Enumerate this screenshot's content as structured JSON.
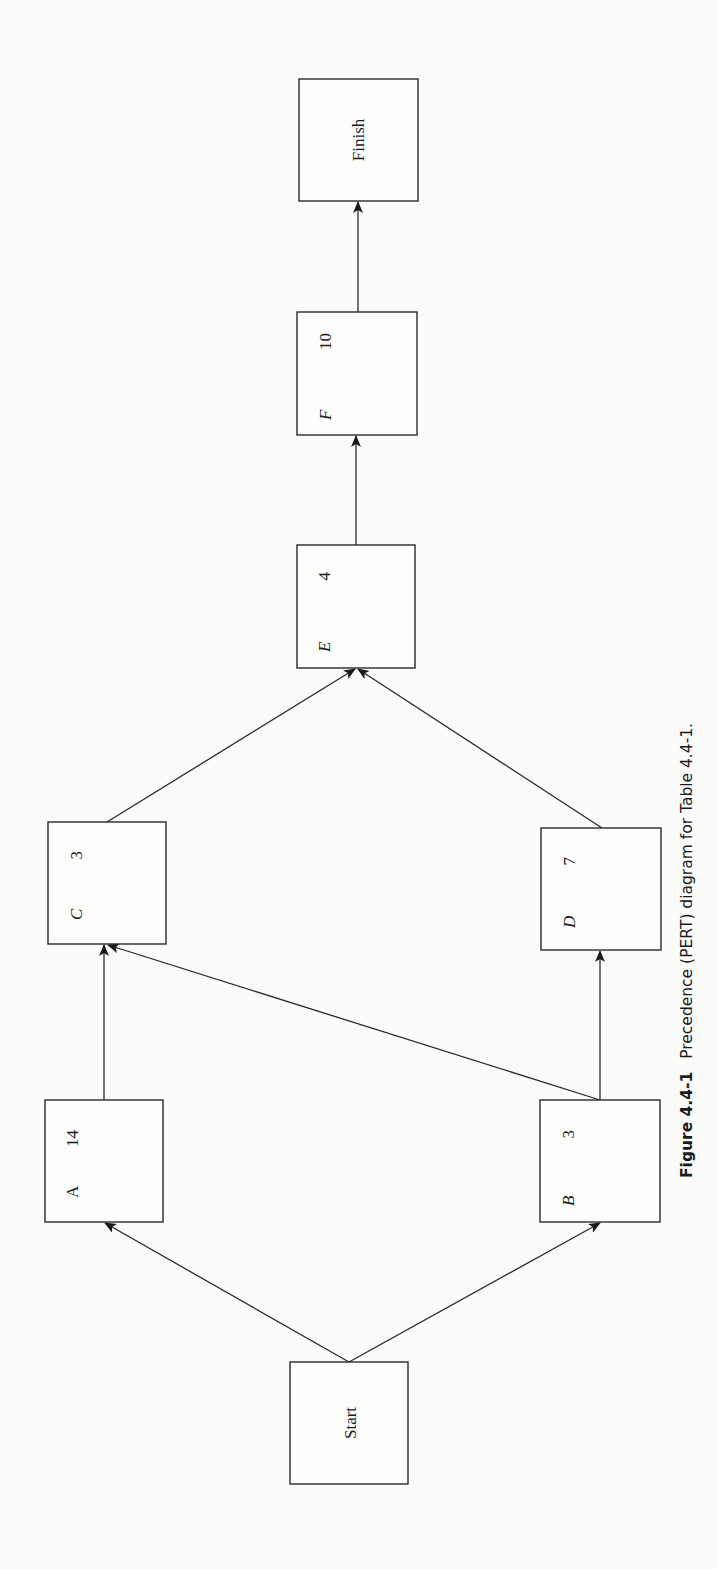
{
  "figure": {
    "caption_label": "Figure 4.4-1",
    "caption_text": "Precedence (PERT) diagram for Table 4.4-1.",
    "orientation": "rotated 90° counter-clockwise"
  },
  "nodes": [
    {
      "id": "start",
      "kind": "terminal",
      "label": "Start"
    },
    {
      "id": "A",
      "kind": "activity",
      "label": "A",
      "duration": "14"
    },
    {
      "id": "B",
      "kind": "activity",
      "label": "B",
      "duration": "3"
    },
    {
      "id": "C",
      "kind": "activity",
      "label": "C",
      "duration": "3"
    },
    {
      "id": "D",
      "kind": "activity",
      "label": "D",
      "duration": "7"
    },
    {
      "id": "E",
      "kind": "activity",
      "label": "E",
      "duration": "4"
    },
    {
      "id": "F",
      "kind": "activity",
      "label": "F",
      "duration": "10"
    },
    {
      "id": "finish",
      "kind": "terminal",
      "label": "Finish"
    }
  ],
  "edges": [
    {
      "from": "start",
      "to": "A"
    },
    {
      "from": "start",
      "to": "B"
    },
    {
      "from": "A",
      "to": "C"
    },
    {
      "from": "B",
      "to": "C"
    },
    {
      "from": "B",
      "to": "D"
    },
    {
      "from": "C",
      "to": "E"
    },
    {
      "from": "D",
      "to": "E"
    },
    {
      "from": "E",
      "to": "F"
    },
    {
      "from": "F",
      "to": "finish"
    }
  ]
}
